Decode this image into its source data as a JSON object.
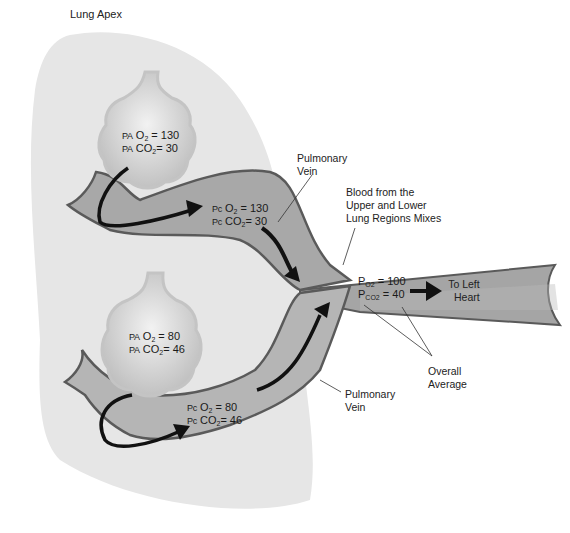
{
  "title": "Lung Apex",
  "upper_alveolus": {
    "o2_prefix": "PA",
    "o2_label": "O",
    "o2_sub": "2",
    "o2_value": "= 130",
    "co2_prefix": "PA",
    "co2_label": "CO",
    "co2_sub": "2",
    "co2_value": "= 30"
  },
  "upper_capillary": {
    "o2_prefix": "Pc",
    "o2_label": "O",
    "o2_sub": "2",
    "o2_value": "= 130",
    "co2_prefix": "Pc",
    "co2_label": "CO",
    "co2_sub": "2",
    "co2_value": "= 30"
  },
  "lower_alveolus": {
    "o2_prefix": "PA",
    "o2_label": "O",
    "o2_sub": "2",
    "o2_value": "= 80",
    "co2_prefix": "PA",
    "co2_label": "CO",
    "co2_sub": "2",
    "co2_value": "= 46"
  },
  "lower_capillary": {
    "o2_prefix": "Pc",
    "o2_label": "O",
    "o2_sub": "2",
    "o2_value": "= 80",
    "co2_prefix": "Pc",
    "co2_label": "CO",
    "co2_sub": "2",
    "co2_value": "= 46"
  },
  "mixed": {
    "o2_prefix": "P",
    "o2_label": "O",
    "o2_sub": "2",
    "o2_value": "= 100",
    "co2_prefix": "P",
    "co2_label": "CO",
    "co2_sub": "2",
    "co2_value": "= 40"
  },
  "labels": {
    "pulmonary_vein_upper_1": "Pulmonary",
    "pulmonary_vein_upper_2": "Vein",
    "pulmonary_vein_lower_1": "Pulmonary",
    "pulmonary_vein_lower_2": "Vein",
    "mixing_1": "Blood from the",
    "mixing_2": "Upper and Lower",
    "mixing_3": "Lung Regions Mixes",
    "to_heart_1": "To Left",
    "to_heart_2": "Heart",
    "overall_1": "Overall",
    "overall_2": "Average"
  },
  "colors": {
    "lung_fill": "#e6e6e6",
    "vein_fill": "#a8a8a8",
    "vein_outline": "#5a5a5a",
    "alveolus_fill": "#cfcfcf",
    "arrow": "#111111"
  }
}
